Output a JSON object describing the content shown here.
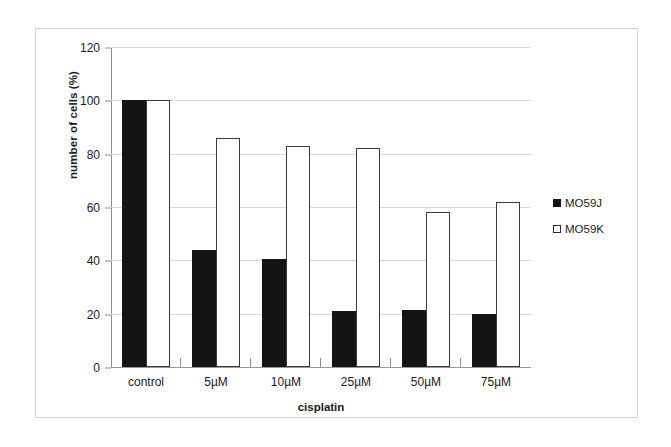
{
  "chart_data": {
    "type": "bar",
    "title": "",
    "xlabel": "cisplatin",
    "ylabel": "number of cells (%)",
    "categories": [
      "control",
      "5µM",
      "10µM",
      "25µM",
      "50µM",
      "75µM"
    ],
    "series": [
      {
        "name": "MO59J",
        "color": "#141414",
        "fill": "solid",
        "values": [
          100,
          44,
          40.5,
          21,
          21.5,
          20
        ]
      },
      {
        "name": "MO59K",
        "color": "#ffffff",
        "fill": "hollow",
        "values": [
          100,
          86,
          83,
          82,
          58,
          62
        ]
      }
    ],
    "ylim": [
      0,
      120
    ],
    "yticks": [
      0,
      20,
      40,
      60,
      80,
      100,
      120
    ],
    "ytick_labels": [
      "0",
      "20",
      "40",
      "60",
      "80",
      "100",
      "120"
    ],
    "grid": true,
    "legend_position": "right"
  },
  "legend": {
    "items": [
      {
        "label": "MO59J",
        "marker": "filled-square-marker"
      },
      {
        "label": "MO59K",
        "marker": "hollow-square-marker"
      }
    ]
  }
}
